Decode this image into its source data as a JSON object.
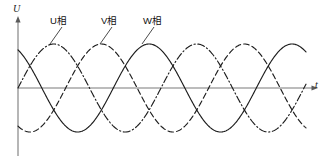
{
  "figure": {
    "title": "",
    "background": "#ffffff",
    "width": 327,
    "height": 167
  },
  "axes": {
    "y_label": "U",
    "x_label": "t",
    "origin_x": 18,
    "zero_y": 88,
    "x_end": 312,
    "y_top": 22,
    "y_bottom": 156,
    "color": "#7a7a7a"
  },
  "annotations": [
    {
      "name": "phase-u-label",
      "text": "U相",
      "x": 50,
      "y": 16,
      "leader": {
        "x1": 62,
        "y1": 27,
        "x2": 50,
        "y2": 44
      }
    },
    {
      "name": "phase-v-label",
      "text": "V相",
      "x": 101,
      "y": 16,
      "leader": {
        "x1": 112,
        "y1": 27,
        "x2": 100,
        "y2": 44
      }
    },
    {
      "name": "phase-w-label",
      "text": "W相",
      "x": 143,
      "y": 16,
      "leader": {
        "x1": 154,
        "y1": 27,
        "x2": 142,
        "y2": 44
      }
    }
  ],
  "chart_data": {
    "type": "line",
    "title": "",
    "xlabel": "t",
    "ylabel": "U",
    "grid": false,
    "legend": "inline-annotations",
    "xlim": [
      0,
      2.05
    ],
    "ylim": [
      -1.15,
      1.15
    ],
    "period": 1.0,
    "amplitude": 1.0,
    "x_pixels_per_period": 143,
    "amplitude_pixels": 44,
    "series": [
      {
        "name": "U相",
        "label": "U相",
        "style": "dash-dot",
        "color": "#1d1d1d",
        "phase_deg": 0,
        "equation": "U = sin(2*pi*t)",
        "peak_x_px": 57,
        "peaks_t": [
          0.25,
          1.25
        ],
        "zeros_t": [
          0.0,
          0.5,
          1.0,
          1.5,
          2.0
        ],
        "troughs_t": [
          0.75,
          1.75
        ]
      },
      {
        "name": "V相",
        "label": "V相",
        "style": "dashed",
        "color": "#1d1d1d",
        "phase_deg": -120,
        "equation": "V = sin(2*pi*t - 2*pi/3)",
        "peak_x_px": 105,
        "peaks_t": [
          0.5833,
          1.5833
        ],
        "zeros_t": [
          0.3333,
          0.8333,
          1.3333,
          1.8333
        ],
        "troughs_t": [
          0.0833,
          1.0833,
          2.0833
        ]
      },
      {
        "name": "W相",
        "label": "W相",
        "style": "solid",
        "color": "#1d1d1d",
        "phase_deg": -240,
        "equation": "W = sin(2*pi*t - 4*pi/3)",
        "peak_x_px": 152,
        "peaks_t": [
          0.9167,
          1.9167
        ],
        "zeros_t": [
          0.1667,
          0.6667,
          1.1667,
          1.6667
        ],
        "troughs_t": [
          0.4167,
          1.4167
        ]
      }
    ]
  }
}
